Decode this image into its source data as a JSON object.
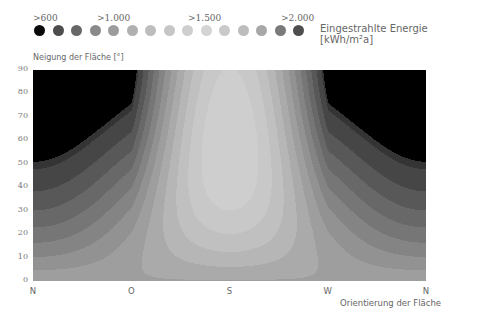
{
  "chart_data": {
    "type": "heatmap",
    "subtype": "filled-contour",
    "title": "",
    "legend": {
      "title": "Eingestrahlte Energie [kWh/m²a]",
      "placement": "top",
      "tick_labels": [
        ">600",
        ">1.000",
        ">1.500",
        ">2.000"
      ],
      "tick_positions_level_index": [
        0,
        4,
        9,
        14
      ],
      "levels": [
        600,
        700,
        800,
        900,
        1000,
        1100,
        1200,
        1300,
        1400,
        1500,
        1600,
        1700,
        1800,
        1900,
        2000
      ],
      "colors": [
        "#0a0a0a",
        "#4d4d4d",
        "#676767",
        "#8a8a8a",
        "#9c9c9c",
        "#b0b0b0",
        "#bdbdbd",
        "#c6c6c6",
        "#cecece",
        "#d4d4d4",
        "#c9c9c9",
        "#bdbdbd",
        "#a8a8a8",
        "#7a7a7a",
        "#4e4e4e"
      ]
    },
    "xlabel": "Orientierung der Fläche",
    "ylabel": "Neigung der Fläche [°]",
    "x_ticks": [
      "N",
      "O",
      "S",
      "W",
      "N"
    ],
    "x_range_deg_azimuth": [
      0,
      360
    ],
    "y_ticks": [
      "0",
      "10",
      "20",
      "30",
      "40",
      "50",
      "60",
      "70",
      "80",
      "90"
    ],
    "y_range": [
      0,
      90
    ],
    "grid": false,
    "peak": {
      "orientation": "S",
      "tilt_deg": 40
    },
    "model_note": "Irradiance field approximated: max near S at ~40° tilt, minimum (<600) at N for tilt > ~35°, flat-roof (0°) ~ mid-level across all orientations"
  }
}
